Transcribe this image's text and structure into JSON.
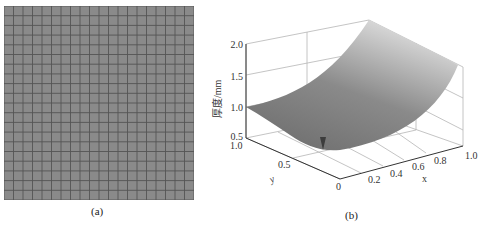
{
  "figure": {
    "panel_a": {
      "caption": "(a)",
      "description": "uniform square mesh grid",
      "grid_rows": 20,
      "grid_cols": 20,
      "fill_color": "#8a8a8a",
      "line_color": "#555555"
    },
    "panel_b": {
      "caption": "(b)",
      "type": "3d-surface"
    }
  },
  "chart_data": {
    "type": "surface",
    "title": "",
    "zlabel": "厚度/mm",
    "xlabel": "x",
    "ylabel": "y",
    "x_ticks": [
      "0",
      "0.2",
      "0.4",
      "0.6",
      "0.8",
      "1.0"
    ],
    "y_ticks": [
      "0",
      "0.5",
      "1.0"
    ],
    "z_ticks": [
      "0.5",
      "1.0",
      "1.5",
      "2.0"
    ],
    "xlim": [
      0,
      1
    ],
    "ylim": [
      0,
      1
    ],
    "zlim": [
      0.5,
      2.0
    ],
    "grid": true,
    "surface_description": "Thickness rises from ~1.0 mm at x=0 to ~2.0 mm at x=1, y=1 (parabolic in x, increasing with y); small downward spike near x≈0.1, y≈0.5",
    "sample_points": [
      {
        "x": 0.0,
        "y": 1.0,
        "z": 1.0
      },
      {
        "x": 0.0,
        "y": 0.0,
        "z": 1.0
      },
      {
        "x": 1.0,
        "y": 1.0,
        "z": 2.0
      },
      {
        "x": 1.0,
        "y": 0.0,
        "z": 1.6
      },
      {
        "x": 0.5,
        "y": 0.5,
        "z": 1.25
      }
    ]
  }
}
